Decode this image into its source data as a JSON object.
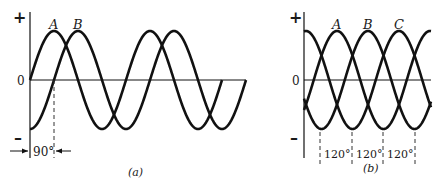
{
  "figure": {
    "colors": {
      "stroke": "#111111",
      "background": "#ffffff"
    }
  },
  "panel_a": {
    "caption": "(a)",
    "axis": {
      "plus": "+",
      "zero": "0",
      "minus": "–"
    },
    "waves": [
      {
        "label": "A",
        "phase_deg": 0
      },
      {
        "label": "B",
        "phase_deg": -90
      }
    ],
    "phase_annotation": "90°"
  },
  "panel_b": {
    "caption": "(b)",
    "axis": {
      "plus": "+",
      "zero": "0",
      "minus": "–"
    },
    "waves": [
      {
        "label": "A",
        "phase_deg": 0
      },
      {
        "label": "B",
        "phase_deg": -120
      },
      {
        "label": "C",
        "phase_deg": -240
      }
    ],
    "phase_annotations": [
      "120°",
      "120°",
      "120°"
    ]
  }
}
